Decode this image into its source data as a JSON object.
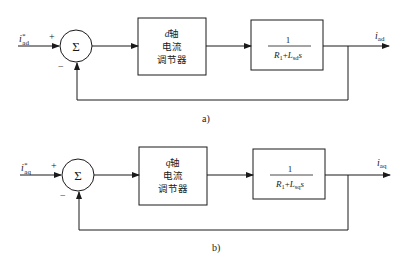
{
  "diagrams": [
    {
      "caption": "a)",
      "input": {
        "symbol": "i",
        "sup": "*",
        "sub": "ad"
      },
      "sum": {
        "symbol": "Σ",
        "plus": "+",
        "minus": "−"
      },
      "controller": {
        "axis": "d",
        "line1": "轴",
        "line2": "电流",
        "line3": "调节器"
      },
      "plant": {
        "numerator": "1",
        "den_R": "R",
        "den_R_sub": "1",
        "den_plus": "+",
        "den_L": "L",
        "den_L_sub": "sd",
        "den_s": "s"
      },
      "output": {
        "symbol": "i",
        "sub": "ad"
      }
    },
    {
      "caption": "b)",
      "input": {
        "symbol": "i",
        "sup": "*",
        "sub": "aq"
      },
      "sum": {
        "symbol": "Σ",
        "plus": "+",
        "minus": "−"
      },
      "controller": {
        "axis": "q",
        "line1": "轴",
        "line2": "电流",
        "line3": "调节器"
      },
      "plant": {
        "numerator": "1",
        "den_R": "R",
        "den_R_sub": "1",
        "den_plus": "+",
        "den_L": "L",
        "den_L_sub": "sq",
        "den_s": "s"
      },
      "output": {
        "symbol": "i",
        "sub": "aq"
      }
    }
  ],
  "colors": {
    "line": "#1a1a1a",
    "background": "#ffffff"
  }
}
